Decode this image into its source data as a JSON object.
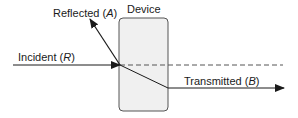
{
  "diagram": {
    "device_label": "Device",
    "incident": {
      "text": "Incident (",
      "var": "R",
      "close": ")"
    },
    "reflected": {
      "text": "Reflected (",
      "var": "A",
      "close": ")"
    },
    "transmitted": {
      "text": "Transmitted (",
      "var": "B",
      "close": ")"
    },
    "colors": {
      "line": "#1a1a1a",
      "device_fill": "#f0f0f0",
      "device_stroke": "#555555",
      "dashed": "#555555"
    }
  }
}
